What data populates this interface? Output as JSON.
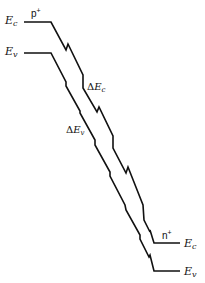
{
  "diagram": {
    "title": "",
    "left_region": {
      "doping_label": {
        "base": "p",
        "sup": "+"
      },
      "ec_label": {
        "base": "E",
        "sub": "c"
      },
      "ev_label": {
        "base": "E",
        "sub": "v"
      }
    },
    "right_region": {
      "doping_label": {
        "base": "n",
        "sup": "+"
      },
      "ec_label": {
        "base": "E",
        "sub": "c"
      },
      "ev_label": {
        "base": "E",
        "sub": "v"
      }
    },
    "annotations": {
      "delta_ec": {
        "prefix": "Δ",
        "base": "E",
        "sub": "c"
      },
      "delta_ev": {
        "prefix": "Δ",
        "base": "E",
        "sub": "v"
      }
    },
    "colors": {
      "line": "#111111",
      "background": "#ffffff"
    },
    "paths": {
      "conduction_band": "M24,22 L51,22 L66,50 L68,44 L83,75 L83,88 L97,112 L99,107 L113,136 L113,148 L126,173 L128,167 L143,205 L144,220 L150,232 L150,230 L154,243 L180,243",
      "valence_band": "M24,53 L51,53 L66,82 L66,86 L80,111 L80,113 L95,140 L95,145 L110,172 L110,176 L125,205 L126,210 L140,235 L140,239 L149,257 L150,255 L154,271 L180,271"
    }
  }
}
